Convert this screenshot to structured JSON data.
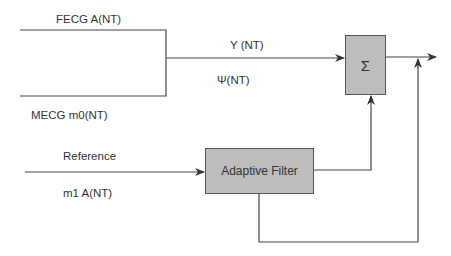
{
  "diagram": {
    "colors": {
      "line": "#444444",
      "box_fill": "#bdbdbd",
      "box_border": "#555555",
      "text": "#333333"
    },
    "labels": {
      "fecg": "FECG A(NT)",
      "mecg": "MECG m0(NT)",
      "y": "Y (NT)",
      "psi": "Ψ(NT)",
      "reference": "Reference",
      "m1": "m1 A(NT)"
    },
    "blocks": {
      "sum": {
        "label": "Σ"
      },
      "filter": {
        "label": "Adaptive Filter"
      }
    }
  }
}
